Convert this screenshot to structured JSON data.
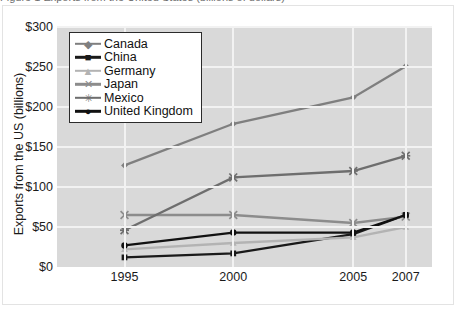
{
  "figure": {
    "title": "Figure 1 Exports from the United States (billions of dollars)",
    "y_axis_title": "Exports from the US (billions)"
  },
  "chart_data": {
    "type": "line",
    "title": "Figure 1 Exports from the United States (billions of dollars)",
    "xlabel": "",
    "ylabel": "Exports from the US (billions)",
    "x": [
      "1995",
      "2000",
      "2005",
      "2007"
    ],
    "x_positions": [
      0.18,
      0.47,
      0.79,
      0.93
    ],
    "ylim": [
      0,
      300
    ],
    "yticks": [
      0,
      50,
      100,
      150,
      200,
      250,
      300
    ],
    "ytick_labels": [
      "$0",
      "$50",
      "$100",
      "$150",
      "$200",
      "$250",
      "$300"
    ],
    "grid": true,
    "legend_position": "top-left",
    "series": [
      {
        "name": "Canada",
        "values": [
          127,
          179,
          212,
          251
        ],
        "color": "#7f7f7f",
        "marker": "diamond"
      },
      {
        "name": "China",
        "values": [
          12,
          17,
          41,
          65
        ],
        "color": "#1a1a1a",
        "marker": "square"
      },
      {
        "name": "Germany",
        "values": [
          22,
          30,
          37,
          50
        ],
        "color": "#b3b3b3",
        "marker": "triangle"
      },
      {
        "name": "Japan",
        "values": [
          65,
          65,
          55,
          63
        ],
        "color": "#8c8c8c",
        "marker": "x"
      },
      {
        "name": "Mexico",
        "values": [
          46,
          112,
          120,
          139
        ],
        "color": "#6e6e6e",
        "marker": "asterisk"
      },
      {
        "name": "United Kingdom",
        "values": [
          27,
          43,
          43,
          65
        ],
        "color": "#111111",
        "marker": "circle"
      }
    ]
  }
}
